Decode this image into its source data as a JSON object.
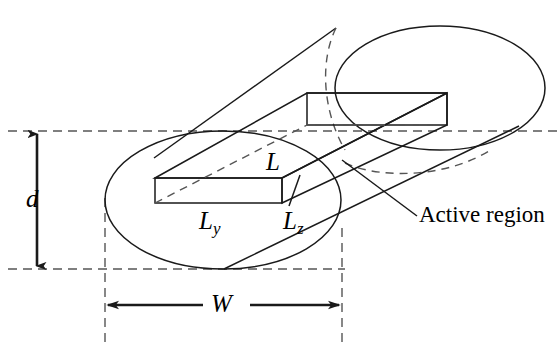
{
  "figure": {
    "background_color": "#ffffff",
    "stroke_color": "#1a1a1a",
    "labels": {
      "d": "d",
      "W": "W",
      "L": "L",
      "L_y_base": "L",
      "L_y_sub": "y",
      "L_z_base": "L",
      "L_z_sub": "z",
      "active_region": "Active region"
    },
    "dimensions": {
      "vertical_label": "d",
      "horizontal_label": "W"
    },
    "annotations": [
      "Active region"
    ],
    "geometry_notes": {
      "near_ellipse_center": "223,200",
      "near_ellipse_radii": "118,69",
      "far_ellipse_center": "440,88",
      "far_ellipse_radii": "105,62",
      "slab_front_face": "155,178 to 282,203"
    }
  }
}
